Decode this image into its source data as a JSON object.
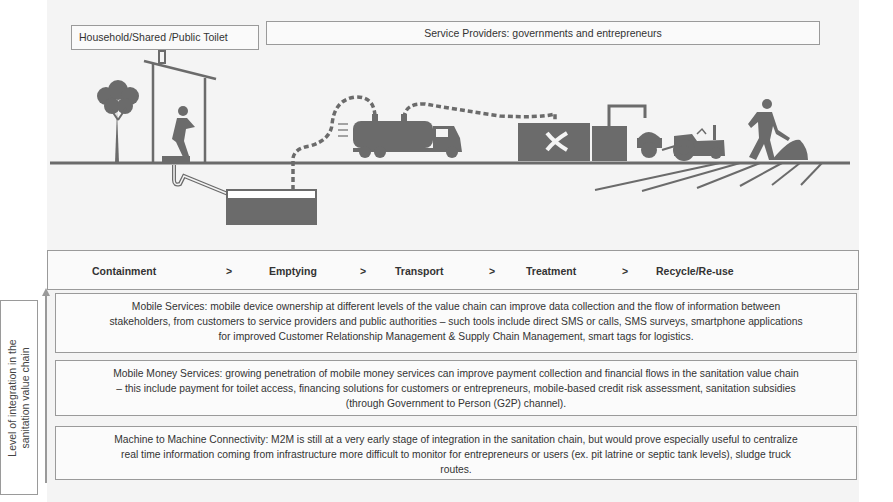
{
  "headers": {
    "toilet": "Household/Shared /Public Toilet",
    "providers": "Service Providers: governments and entrepreneurs"
  },
  "illustration": {
    "icons": [
      "tree-icon",
      "latrine-icon",
      "squatting-person-icon",
      "pipe-icon",
      "septic-tank-icon",
      "vacuum-hose-icon",
      "vacuum-truck-icon",
      "treatment-plant-icon",
      "digester-tank-icon",
      "tractor-trailer-icon",
      "farmer-shoveling-icon",
      "field-furrows-icon"
    ],
    "colors": {
      "ink": "#6b6b6b",
      "ground": "#707070",
      "background": "#f4f4f4"
    }
  },
  "value_chain": {
    "stages": [
      "Containment",
      "Emptying",
      "Transport",
      "Treatment",
      "Recycle/Re-use"
    ],
    "separator": ">"
  },
  "side_label": {
    "line1": "Level of integration in the",
    "line2": "sanitation value chain"
  },
  "boxes": [
    {
      "id": "mobile-services",
      "lines": [
        "Mobile Services: mobile device ownership at different levels of the value chain can improve data collection and the flow of information between",
        "stakeholders, from customers to service providers and public authorities – such tools include direct SMS or calls, SMS surveys, smartphone applications",
        "for improved Customer Relationship Management & Supply Chain Management, smart tags for logistics."
      ]
    },
    {
      "id": "mobile-money",
      "lines": [
        "Mobile Money Services: growing penetration of mobile money services can improve payment collection and financial flows in the sanitation value chain",
        "– this include payment for toilet access, financing solutions for customers or entrepreneurs, mobile-based credit risk assessment,  sanitation subsidies",
        "(through Government to Person (G2P) channel)."
      ]
    },
    {
      "id": "m2m",
      "lines": [
        "Machine to Machine Connectivity: M2M is still at a very early stage of integration in the sanitation chain, but would prove especially useful to centralize",
        "real time information coming from infrastructure more difficult to monitor for entrepreneurs or users (ex. pit latrine or septic tank levels), sludge truck",
        "routes."
      ]
    }
  ]
}
